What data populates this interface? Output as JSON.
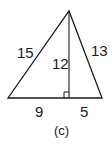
{
  "figure": {
    "caption": "(c)",
    "labels": {
      "left_side": "15",
      "right_side": "13",
      "altitude": "12",
      "base_left": "9",
      "base_right": "5"
    },
    "stroke_color": "#1a1a1a"
  }
}
